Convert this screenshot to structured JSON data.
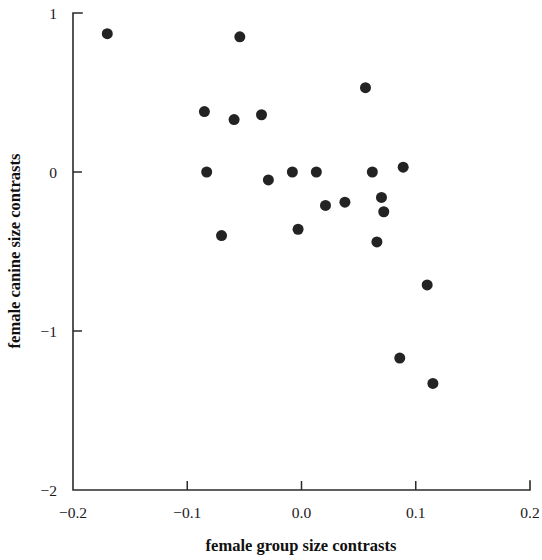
{
  "chart_data": {
    "type": "scatter",
    "title": "",
    "xlabel": "female group size contrasts",
    "ylabel": "female canine size contrasts",
    "xlim": [
      -0.2,
      0.2
    ],
    "ylim": [
      -2,
      1
    ],
    "xticks": [
      -0.2,
      -0.1,
      0.0,
      0.1,
      0.2
    ],
    "xtick_labels": [
      "−0.2",
      "−0.1",
      "0.0",
      "0.1",
      "0.2"
    ],
    "yticks": [
      1,
      0,
      -1,
      -2
    ],
    "ytick_labels": [
      "1",
      "0",
      "−1",
      "−2"
    ],
    "grid": false,
    "legend": null,
    "marker": "filled-circle",
    "marker_color": "#232323",
    "marker_size_px": 11,
    "n_points": 26,
    "points": [
      {
        "x": -0.17,
        "y": 0.87
      },
      {
        "x": -0.054,
        "y": 0.85
      },
      {
        "x": 0.056,
        "y": 0.53
      },
      {
        "x": -0.085,
        "y": 0.38
      },
      {
        "x": -0.059,
        "y": 0.33
      },
      {
        "x": -0.035,
        "y": 0.36
      },
      {
        "x": -0.083,
        "y": 0.0
      },
      {
        "x": -0.029,
        "y": -0.05
      },
      {
        "x": -0.008,
        "y": 0.0
      },
      {
        "x": 0.013,
        "y": 0.0
      },
      {
        "x": 0.062,
        "y": 0.0
      },
      {
        "x": 0.089,
        "y": 0.03
      },
      {
        "x": 0.021,
        "y": -0.21
      },
      {
        "x": 0.038,
        "y": -0.19
      },
      {
        "x": 0.07,
        "y": -0.16
      },
      {
        "x": 0.072,
        "y": -0.25
      },
      {
        "x": -0.07,
        "y": -0.4
      },
      {
        "x": -0.003,
        "y": -0.36
      },
      {
        "x": 0.066,
        "y": -0.44
      },
      {
        "x": 0.11,
        "y": -0.71
      },
      {
        "x": 0.086,
        "y": -1.17
      },
      {
        "x": 0.115,
        "y": -1.33
      }
    ]
  },
  "axes": {
    "x_axis_name": "x-axis",
    "y_axis_name": "y-axis"
  }
}
